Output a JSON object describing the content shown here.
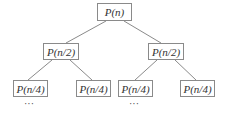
{
  "diagram": {
    "type": "tree",
    "root": {
      "label": "P(n)"
    },
    "level1": [
      {
        "label": "P(n/2)"
      },
      {
        "label": "P(n/2)"
      }
    ],
    "level2": [
      {
        "label": "P(n/4)"
      },
      {
        "label": "P(n/4)"
      },
      {
        "label": "P(n/4)"
      },
      {
        "label": "P(n/4)"
      }
    ],
    "continuation": [
      {
        "label": "···"
      },
      {
        "label": "···"
      }
    ],
    "colors": {
      "border": "#8a8a8a",
      "edge": "#8a8a8a",
      "text": "#333333",
      "background": "#ffffff"
    }
  }
}
